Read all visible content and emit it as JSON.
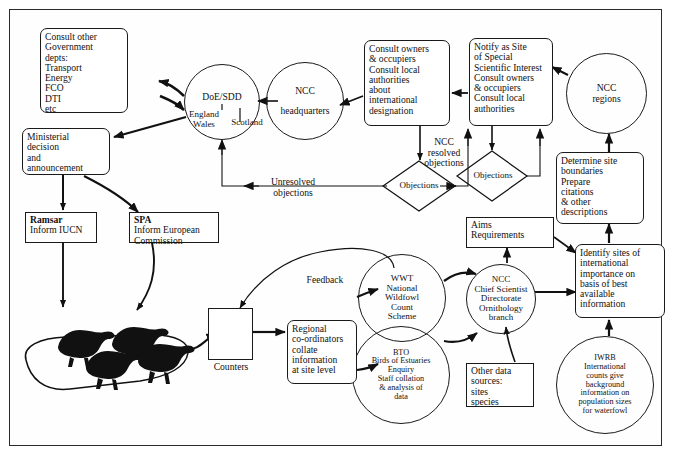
{
  "diagram": {
    "frame_color": "#2b2b2b",
    "line_color": "#111111",
    "bird_color": "#111111"
  },
  "nodes": {
    "consult_other_govt": "Consult other\nGovernment\ndepts:\nTransport\nEnergy\nFCO\nDTI\netc",
    "ministerial": "Ministerial\ndecision\nand\nannouncement",
    "ramsar_head": "Ramsar",
    "ramsar_body": "Inform IUCN",
    "spa_head": "SPA",
    "spa_body": "Inform European\nCommission",
    "doe_sdd_title": "DoE/SDD",
    "doe_sdd_left": "England\nWales",
    "doe_sdd_right": "Scotland",
    "ncc_headquarters": "NCC\n\nheadquarters",
    "consult_owners_intl": "Consult owners\n& occupiers\nConsult local\nauthorities\nabout\ninternational\ndesignation",
    "notify_sssi": "Notify as Site\nof Special\nScientific Interest\nConsult owners\n& occupiers\nConsult local\nauthorities",
    "ncc_regions": "NCC\nregions",
    "determine_boundaries": "Determine site\nboundaries\nPrepare\ncitations\n& other\ndescriptions",
    "identify_sites": "Identify sites of\ninternational\nimportance on\nbasis of best\navailable\ninformation",
    "iwrb": "IWRB\nInternational\ncounts give\nbackground\ninformation on\npopulation sizes\nfor waterfowl",
    "aims_requirements": "Aims\nRequirements",
    "ncc_chief_scientist": "NCC\nChief Scientist\nDirectorate\nOrnithology\nbranch",
    "wwt": "WWT\nNational\nWildfowl\nCount\nScheme",
    "bto": "BTO\nBirds of Estuaries\nEnquiry\nStaff collation\n& analysis of\ndata",
    "other_data": "Other data\nsources:\nsites\nspecies",
    "regional_coordinators": "Regional\nco-ordinators\ncollate\ninformation\nat site level",
    "objections_left": "Objections",
    "objections_right": "Objections"
  },
  "edge_labels": {
    "unresolved_objections": "Unresolved\nobjections",
    "ncc_resolved_objections": "NCC\nresolved\nobjections",
    "feedback": "Feedback",
    "counters": "Counters"
  },
  "icons": {
    "counter_person": "counter-person-icon",
    "waterfowl": "waterfowl-silhouettes-icon"
  }
}
